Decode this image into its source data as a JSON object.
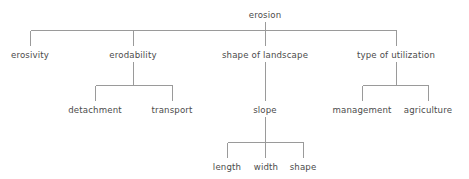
{
  "diagram": {
    "type": "hierarchy-tree",
    "title": "erosion",
    "style": {
      "line_color": "#9a9a9a",
      "text_color": "#4b4b4b",
      "background_color": "#ffffff",
      "line_width": 1
    },
    "nodes": {
      "root": {
        "label": "erosion",
        "x": 265,
        "y": 16,
        "level": 0
      },
      "level1": [
        {
          "label": "erosivity",
          "x": 30,
          "y": 57,
          "level": 1
        },
        {
          "label": "erodability",
          "x": 133,
          "y": 57,
          "level": 1
        },
        {
          "label": "shape of landscape",
          "x": 265,
          "y": 57,
          "level": 1
        },
        {
          "label": "type of utilization",
          "x": 396,
          "y": 57,
          "level": 1
        }
      ],
      "level2": [
        {
          "label": "detachment",
          "x": 95,
          "y": 112,
          "level": 2,
          "parent": "erodability"
        },
        {
          "label": "transport",
          "x": 172,
          "y": 112,
          "level": 2,
          "parent": "erodability"
        },
        {
          "label": "slope",
          "x": 265,
          "y": 112,
          "level": 2,
          "parent": "shape of landscape"
        },
        {
          "label": "management",
          "x": 362,
          "y": 112,
          "level": 2,
          "parent": "type of utilization"
        },
        {
          "label": "agriculture",
          "x": 428,
          "y": 112,
          "level": 2,
          "parent": "type of utilization"
        }
      ],
      "level3": [
        {
          "label": "length",
          "x": 227,
          "y": 169,
          "level": 3,
          "parent": "slope"
        },
        {
          "label": "width",
          "x": 266,
          "y": 169,
          "level": 3,
          "parent": "slope"
        },
        {
          "label": "shape",
          "x": 303,
          "y": 169,
          "level": 3,
          "parent": "slope"
        }
      ]
    }
  }
}
